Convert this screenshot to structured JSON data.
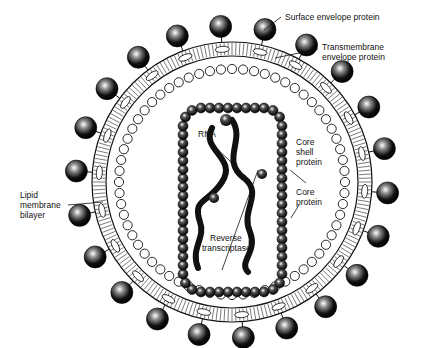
{
  "diagram": {
    "labels": {
      "surface_envelope_protein": "Surface envelope protein",
      "transmembrane_envelope_protein_1": "Transmembrane",
      "transmembrane_envelope_protein_2": "envelope protein",
      "lipid_1": "Lipid",
      "lipid_2": "membrane",
      "lipid_3": "bilayer",
      "rna": "RNA",
      "core_shell_1": "Core",
      "core_shell_2": "shell",
      "core_shell_3": "protein",
      "core_protein_1": "Core",
      "core_protein_2": "protein",
      "rt_1": "Reverse",
      "rt_2": "transcriptase"
    },
    "colors": {
      "ink": "#111111",
      "background": "#ffffff"
    }
  }
}
